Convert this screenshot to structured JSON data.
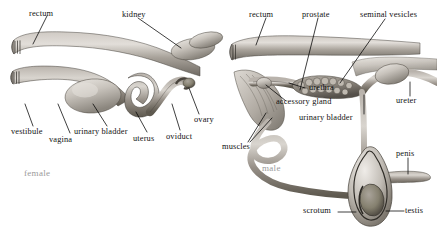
{
  "figure": {
    "panels": [
      {
        "id": "female",
        "caption": "female",
        "caption_color": "#9a9a9a",
        "labels": [
          {
            "name": "rectum",
            "text": "rectum"
          },
          {
            "name": "kidney",
            "text": "kidney"
          },
          {
            "name": "vestibule",
            "text": "vestibule"
          },
          {
            "name": "vagina",
            "text": "vagina"
          },
          {
            "name": "urinary-bladder",
            "text": "urinary bladder"
          },
          {
            "name": "uterus",
            "text": "uterus"
          },
          {
            "name": "oviduct",
            "text": "oviduct"
          },
          {
            "name": "ovary",
            "text": "ovary"
          }
        ]
      },
      {
        "id": "male",
        "caption": "male",
        "caption_color": "#9a9a9a",
        "labels": [
          {
            "name": "rectum",
            "text": "rectum"
          },
          {
            "name": "prostate",
            "text": "prostate"
          },
          {
            "name": "seminal-vesicles",
            "text": "seminal vesicles"
          },
          {
            "name": "urethra",
            "text": "urethra"
          },
          {
            "name": "accessory-gland",
            "text": "accessory gland"
          },
          {
            "name": "urinary-bladder",
            "text": "urinary bladder"
          },
          {
            "name": "ureter",
            "text": "ureter"
          },
          {
            "name": "muscles",
            "text": "muscles"
          },
          {
            "name": "penis",
            "text": "penis"
          },
          {
            "name": "scrotum",
            "text": "scrotum"
          },
          {
            "name": "testis",
            "text": "testis"
          }
        ]
      }
    ],
    "palette": {
      "background": "#ffffff",
      "label_text": "#111111",
      "caption_text": "#9a9a9a",
      "leader_line": "#000000",
      "tissue_light": "#d8d4cf",
      "tissue_mid": "#a9a39c",
      "tissue_dark": "#6e6962",
      "outline": "#3a3733"
    }
  }
}
